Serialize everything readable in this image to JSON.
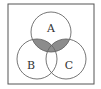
{
  "diagram": {
    "type": "venn",
    "universe": {
      "x": 8,
      "y": 4,
      "width": 86,
      "height": 80,
      "stroke": "#555555"
    },
    "sets": [
      {
        "id": "A",
        "label": "A",
        "cx": 51,
        "cy": 32,
        "r": 20,
        "label_x": 51,
        "label_y": 29
      },
      {
        "id": "B",
        "label": "B",
        "cx": 37,
        "cy": 59,
        "r": 20,
        "label_x": 31,
        "label_y": 66
      },
      {
        "id": "C",
        "label": "C",
        "cx": 66,
        "cy": 59,
        "r": 20,
        "label_x": 69,
        "label_y": 66
      }
    ],
    "shaded_region": "A ∩ (B ∪ C)",
    "shade_color": "#8c8c8c",
    "stroke_color": "#666666"
  }
}
